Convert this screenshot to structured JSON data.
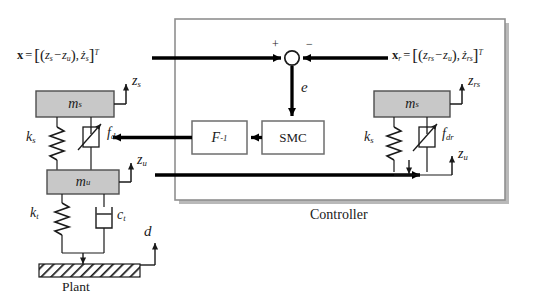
{
  "diagram": {
    "title_caption": "",
    "type": "control-system-block-diagram",
    "domain": "semi-active suspension sliding mode control"
  },
  "controller": {
    "label": "Controller",
    "box_fill": "#ffffff",
    "box_border": "#8c8c8c",
    "shadow_color": "#b4b4b4"
  },
  "blocks": {
    "smc": {
      "label": "SMC",
      "name": "sliding-mode-controller"
    },
    "finv": {
      "label": "F",
      "exponent": "-1",
      "name": "inverse-model"
    }
  },
  "summing_junction": {
    "plus_sign": "+",
    "minus_sign": "−",
    "error_label": "e",
    "name": "error-summing-junction"
  },
  "state_vectors": {
    "plant": {
      "name_bold": "x",
      "equals": "=",
      "open_bracket": "[",
      "term1_a": "z",
      "term1_a_sub": "s",
      "minus": "−",
      "term1_b": "z",
      "term1_b_sub": "u",
      "comma": ",",
      "term2": "ż",
      "term2_sub": "s",
      "close_bracket": "]",
      "transpose": "T",
      "full_text": "x = [ (z_s − z_u), ż_s ]^T"
    },
    "reference": {
      "name_bold": "x",
      "name_sub": "r",
      "equals": "=",
      "open_bracket": "[",
      "term1_a": "z",
      "term1_a_sub": "rs",
      "minus": "−",
      "term1_b": "z",
      "term1_b_sub": "u",
      "comma": ",",
      "term2": "ż",
      "term2_sub": "rs",
      "close_bracket": "]",
      "transpose": "T",
      "full_text": "x_r = [ (z_rs − z_u), ż_rs ]^T"
    }
  },
  "plant_model": {
    "caption": "Plant",
    "sprung_mass": {
      "symbol": "m",
      "sub": "s"
    },
    "unsprung_mass": {
      "symbol": "m",
      "sub": "u"
    },
    "suspension_spring": {
      "symbol": "k",
      "sub": "s"
    },
    "tire_spring": {
      "symbol": "k",
      "sub": "t"
    },
    "tire_damper": {
      "symbol": "c",
      "sub": "t"
    },
    "actuator_force": {
      "symbol": "f",
      "sub": "d"
    },
    "sprung_disp": {
      "symbol": "z",
      "sub": "s"
    },
    "unsprung_disp": {
      "symbol": "z",
      "sub": "u"
    },
    "road_input": {
      "symbol": "d",
      "sub": ""
    },
    "mass_fill": "#c8c8c8",
    "mass_border": "#4d4d4d"
  },
  "reference_model": {
    "sprung_mass": {
      "symbol": "m",
      "sub": "s"
    },
    "suspension_spring": {
      "symbol": "k",
      "sub": "s"
    },
    "actuator_force": {
      "symbol": "f",
      "sub": "dr"
    },
    "sprung_disp": {
      "symbol": "z",
      "sub": "rs"
    },
    "unsprung_disp": {
      "symbol": "z",
      "sub": "u"
    },
    "mass_fill": "#c8c8c8",
    "mass_border": "#4d4d4d"
  },
  "style": {
    "signal_line_color": "#000000",
    "thin_line_color": "#5a5a5a"
  }
}
